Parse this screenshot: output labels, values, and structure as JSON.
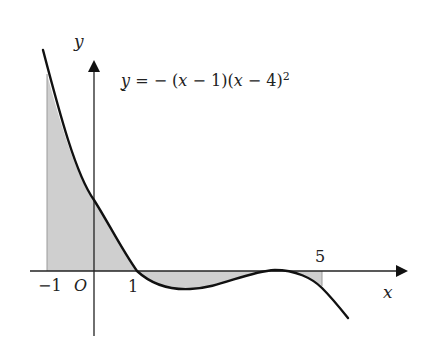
{
  "diagram": {
    "type": "function-graph",
    "equation": {
      "prefix": "y = − (",
      "var1": "x",
      "mid1": " − 1)(",
      "var2": "x",
      "mid2": " − 4)",
      "exponent": "2"
    },
    "axes": {
      "x_label": "x",
      "y_label": "y",
      "origin_label": "O"
    },
    "tick_labels": {
      "neg_one": "−1",
      "one": "1",
      "five": "5"
    },
    "shaded_region": {
      "from_x": -1,
      "to_x": 5,
      "description": "Area between curve and x-axis from x = −1 to x = 5"
    },
    "colors": {
      "curve": "#111111",
      "axis": "#222222",
      "shade": "#cfcfcf"
    }
  }
}
